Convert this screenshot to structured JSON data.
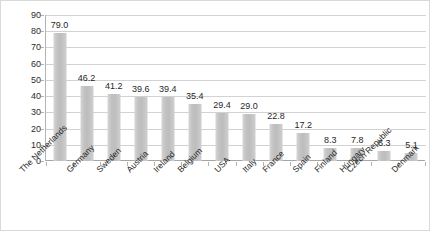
{
  "chart_data": {
    "type": "bar",
    "title": "",
    "subtitle": "",
    "xlabel": "",
    "ylabel": "",
    "ylim": [
      0,
      90
    ],
    "y_ticks": [
      0,
      10,
      20,
      30,
      40,
      50,
      60,
      70,
      80,
      90
    ],
    "grid": true,
    "legend": "none",
    "orientation": "vertical",
    "value_label_format": "one-decimal",
    "x_label_rotation_deg": -45,
    "categories": [
      "The Netherlands",
      "Germany",
      "Sweden",
      "Austria",
      "Ireland",
      "Belgium",
      "USA",
      "Italy",
      "France",
      "Spain",
      "Finland",
      "Hungary",
      "Czech Republic",
      "Denmark"
    ],
    "values": [
      79.0,
      46.2,
      41.2,
      39.6,
      39.4,
      35.4,
      29.4,
      29.0,
      22.8,
      17.2,
      8.3,
      7.8,
      6.3,
      5.1
    ],
    "value_labels": [
      "79.0",
      "46.2",
      "41.2",
      "39.6",
      "39.4",
      "35.4",
      "29.4",
      "29.0",
      "22.8",
      "17.2",
      "8.3",
      "7.8",
      "6.3",
      "5.1"
    ],
    "y_tick_labels": [
      "0",
      "10",
      "20",
      "30",
      "40",
      "50",
      "60",
      "70",
      "80",
      "90"
    ],
    "colors": {
      "bar_fill": "#c2c2c2",
      "bar_fill_light": "#d6d6d6",
      "gridline": "#d2d2d2",
      "axis": "#b3b3b3",
      "text": "#1f1f1f",
      "frame_border": "#d9d9d9",
      "background": "#ffffff"
    }
  }
}
